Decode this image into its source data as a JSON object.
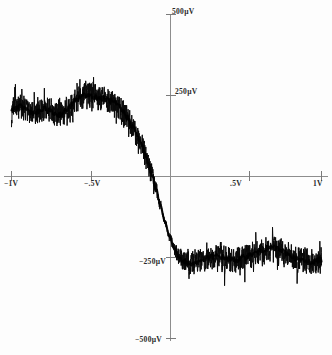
{
  "figure": {
    "name": "noisy-dispersive-curve",
    "background_color": "#fdfdfd",
    "trace_color": "#000000",
    "axis_color": "#8d8d8d"
  },
  "labels": {
    "y_top": "500µV",
    "y_high": "250µV",
    "y_low": "−250µV",
    "y_bottom": "−500µV",
    "x_left": "−1V",
    "x_mid_left": "−.5V",
    "x_mid_right": ".5V",
    "x_right": "1V"
  },
  "chart_data": {
    "type": "line",
    "title": "",
    "xlabel": "",
    "ylabel": "",
    "xlim": [
      -1,
      1
    ],
    "ylim": [
      -500,
      500
    ],
    "grid": false,
    "legend": null,
    "x_ticks": [
      -1,
      -0.5,
      0.5,
      1
    ],
    "x_tick_labels": [
      "−1V",
      "−.5V",
      ".5V",
      "1V"
    ],
    "y_ticks": [
      -500,
      -250,
      250,
      500
    ],
    "y_tick_labels": [
      "−500µV",
      "−250µV",
      "250µV",
      "500µV"
    ],
    "units": {
      "x": "V",
      "y": "µV"
    },
    "series": [
      {
        "name": "signal",
        "noise_amplitude": 55,
        "x": [
          -1.0,
          -0.97,
          -0.94,
          -0.91,
          -0.88,
          -0.85,
          -0.82,
          -0.79,
          -0.76,
          -0.73,
          -0.7,
          -0.67,
          -0.64,
          -0.61,
          -0.58,
          -0.55,
          -0.52,
          -0.49,
          -0.46,
          -0.43,
          -0.4,
          -0.37,
          -0.34,
          -0.31,
          -0.28,
          -0.25,
          -0.22,
          -0.19,
          -0.16,
          -0.13,
          -0.1,
          -0.07,
          -0.04,
          -0.01,
          0.02,
          0.05,
          0.08,
          0.11,
          0.14,
          0.17,
          0.2,
          0.23,
          0.26,
          0.29,
          0.32,
          0.35,
          0.38,
          0.41,
          0.44,
          0.47,
          0.5,
          0.53,
          0.56,
          0.59,
          0.62,
          0.65,
          0.68,
          0.71,
          0.74,
          0.77,
          0.8,
          0.83,
          0.86,
          0.89,
          0.92,
          0.95,
          0.98,
          1.0
        ],
        "values": [
          205,
          212,
          215,
          210,
          200,
          196,
          200,
          208,
          204,
          196,
          190,
          196,
          208,
          222,
          236,
          248,
          252,
          250,
          245,
          242,
          240,
          236,
          228,
          216,
          200,
          180,
          156,
          128,
          96,
          58,
          14,
          -34,
          -88,
          -140,
          -186,
          -222,
          -248,
          -262,
          -268,
          -268,
          -264,
          -258,
          -252,
          -248,
          -246,
          -248,
          -252,
          -256,
          -258,
          -256,
          -250,
          -244,
          -238,
          -232,
          -226,
          -222,
          -220,
          -222,
          -228,
          -236,
          -244,
          -252,
          -258,
          -262,
          -264,
          -262,
          -258,
          -255
        ]
      }
    ]
  }
}
